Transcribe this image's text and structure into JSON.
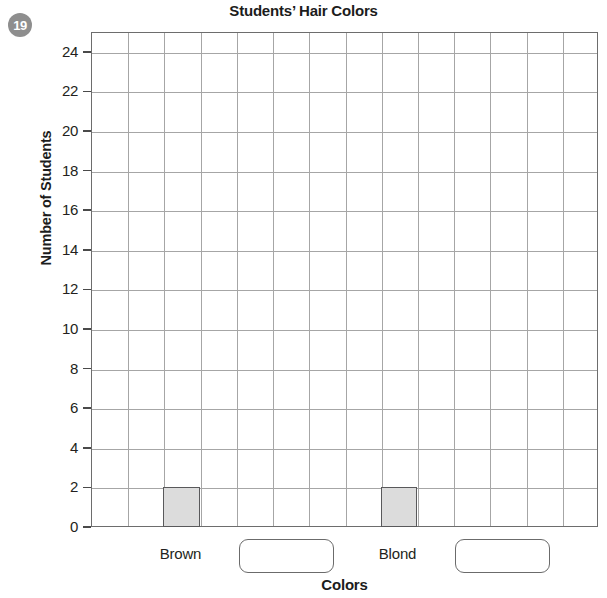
{
  "question": {
    "number": "19"
  },
  "chart_data": {
    "type": "bar",
    "title": "Students’ Hair Colors",
    "xlabel": "Colors",
    "ylabel": "Number of Students",
    "categories": [
      "Brown",
      "",
      "Blond",
      ""
    ],
    "values": [
      2,
      null,
      2,
      null
    ],
    "ylim": [
      0,
      25
    ],
    "ytick_labels": [
      "0",
      "2",
      "4",
      "6",
      "8",
      "10",
      "12",
      "14",
      "16",
      "18",
      "20",
      "22",
      "24"
    ],
    "ytick_values": [
      0,
      2,
      4,
      6,
      8,
      10,
      12,
      14,
      16,
      18,
      20,
      22,
      24
    ],
    "grid": true,
    "grid_columns": 14,
    "legend": "none",
    "bar_fill_color": "#dcdcdc",
    "bar_border_color": "#59595b",
    "gridline_color": "#a6a6a6",
    "axis_color": "#6d6d6d",
    "bars": [
      {
        "label": "Brown",
        "value": 2,
        "column": 3
      },
      {
        "label": "Blond",
        "value": 2,
        "column": 9
      }
    ],
    "answer_boxes": [
      {
        "name": "answer-box-1",
        "value": "",
        "placeholder": ""
      },
      {
        "name": "answer-box-2",
        "value": "",
        "placeholder": ""
      }
    ]
  }
}
